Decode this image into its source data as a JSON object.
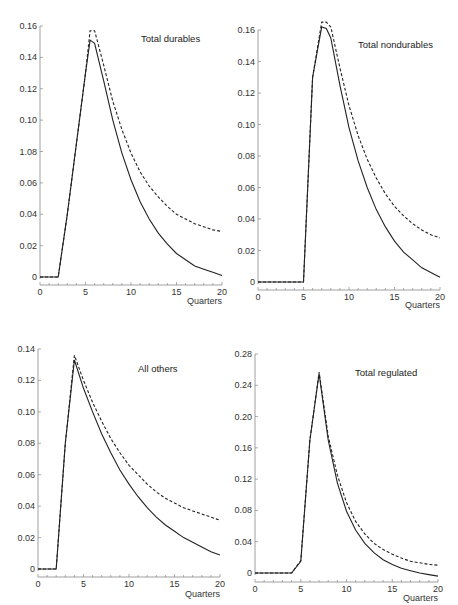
{
  "page": {
    "page_number": "217"
  },
  "chart_data": [
    {
      "type": "line",
      "title": "Total durables",
      "xlabel": "Quarters",
      "ylabel": "",
      "xlim": [
        0,
        20
      ],
      "ylim": [
        0,
        0.16
      ],
      "x_ticks": [
        "0",
        "5",
        "10",
        "15",
        "20"
      ],
      "y_ticks": [
        "0",
        "0.02",
        "0.04",
        "0.06",
        "1.08",
        "0.10",
        "0.12",
        "0.14",
        "0.16"
      ],
      "grid": false,
      "x": [
        0,
        1,
        2,
        3,
        4,
        5,
        5.5,
        6,
        7,
        8,
        9,
        10,
        11,
        12,
        13,
        14,
        15,
        16,
        17,
        18,
        19,
        20
      ],
      "series": [
        {
          "name": "solid",
          "style": "solid",
          "values": [
            0,
            0,
            0,
            0.04,
            0.085,
            0.13,
            0.151,
            0.149,
            0.125,
            0.1,
            0.079,
            0.062,
            0.048,
            0.037,
            0.028,
            0.021,
            0.015,
            0.011,
            0.007,
            0.005,
            0.003,
            0.001
          ]
        },
        {
          "name": "dashed",
          "style": "dashed",
          "values": [
            0,
            0,
            0,
            0.04,
            0.085,
            0.13,
            0.157,
            0.157,
            0.135,
            0.112,
            0.094,
            0.079,
            0.067,
            0.058,
            0.051,
            0.045,
            0.04,
            0.037,
            0.034,
            0.032,
            0.03,
            0.029
          ]
        }
      ]
    },
    {
      "type": "line",
      "title": "Total nondurables",
      "xlabel": "Quarters",
      "ylabel": "",
      "xlim": [
        0,
        20
      ],
      "ylim": [
        0,
        0.16
      ],
      "x_ticks": [
        "0",
        "5",
        "10",
        "15",
        "20"
      ],
      "y_ticks": [
        "0",
        "0.02",
        "0.04",
        "0.06",
        "0.08",
        "0.10",
        "0.12",
        "0.14",
        "0.16"
      ],
      "grid": false,
      "x": [
        0,
        1,
        2,
        3,
        4,
        5,
        6,
        7,
        7.5,
        8,
        9,
        10,
        11,
        12,
        13,
        14,
        15,
        16,
        17,
        18,
        19,
        20
      ],
      "series": [
        {
          "name": "solid",
          "style": "solid",
          "values": [
            0,
            0,
            0,
            0,
            0,
            0,
            0.13,
            0.162,
            0.161,
            0.155,
            0.125,
            0.098,
            0.077,
            0.06,
            0.046,
            0.035,
            0.026,
            0.019,
            0.014,
            0.009,
            0.006,
            0.003
          ]
        },
        {
          "name": "dashed",
          "style": "dashed",
          "values": [
            0,
            0,
            0,
            0,
            0,
            0,
            0.13,
            0.165,
            0.165,
            0.162,
            0.136,
            0.112,
            0.093,
            0.078,
            0.066,
            0.056,
            0.048,
            0.042,
            0.037,
            0.033,
            0.03,
            0.028
          ]
        }
      ]
    },
    {
      "type": "line",
      "title": "All others",
      "xlabel": "Quarters",
      "ylabel": "",
      "xlim": [
        0,
        20
      ],
      "ylim": [
        0,
        0.14
      ],
      "x_ticks": [
        "0",
        "5",
        "10",
        "15",
        "20"
      ],
      "y_ticks": [
        "0",
        "0.02",
        "0.04",
        "0.06",
        "0.08",
        "0.10",
        "0.12",
        "0.14"
      ],
      "grid": false,
      "x": [
        0,
        1,
        2,
        3,
        4,
        5,
        6,
        7,
        8,
        9,
        10,
        11,
        12,
        13,
        14,
        15,
        16,
        17,
        18,
        19,
        20
      ],
      "series": [
        {
          "name": "solid",
          "style": "solid",
          "values": [
            0,
            0,
            0,
            0.08,
            0.133,
            0.115,
            0.1,
            0.086,
            0.074,
            0.063,
            0.054,
            0.046,
            0.039,
            0.033,
            0.028,
            0.024,
            0.02,
            0.017,
            0.014,
            0.011,
            0.009
          ]
        },
        {
          "name": "dashed",
          "style": "dashed",
          "values": [
            0,
            0,
            0,
            0.08,
            0.136,
            0.12,
            0.106,
            0.094,
            0.083,
            0.074,
            0.066,
            0.06,
            0.054,
            0.049,
            0.045,
            0.042,
            0.039,
            0.037,
            0.035,
            0.033,
            0.031
          ]
        }
      ]
    },
    {
      "type": "line",
      "title": "Total regulated",
      "xlabel": "Quarters",
      "ylabel": "",
      "xlim": [
        0,
        20
      ],
      "ylim": [
        0,
        0.28
      ],
      "x_ticks": [
        "0",
        "5",
        "10",
        "15",
        "20"
      ],
      "y_ticks": [
        "0",
        "0.04",
        "0.08",
        "0.12",
        "0.16",
        "0.20",
        "0.24",
        "0.28"
      ],
      "grid": false,
      "x": [
        0,
        1,
        2,
        3,
        4,
        5,
        6,
        7,
        8,
        9,
        10,
        11,
        12,
        13,
        14,
        15,
        16,
        17,
        18,
        19,
        20
      ],
      "series": [
        {
          "name": "solid",
          "style": "solid",
          "values": [
            0,
            0,
            0,
            0,
            0,
            0.015,
            0.17,
            0.255,
            0.17,
            0.115,
            0.079,
            0.055,
            0.038,
            0.026,
            0.017,
            0.011,
            0.006,
            0.003,
            0.0,
            -0.002,
            -0.004
          ]
        },
        {
          "name": "dashed",
          "style": "dashed",
          "values": [
            0,
            0,
            0,
            0,
            0,
            0.016,
            0.17,
            0.257,
            0.175,
            0.125,
            0.09,
            0.066,
            0.05,
            0.038,
            0.03,
            0.024,
            0.019,
            0.015,
            0.013,
            0.011,
            0.01
          ]
        }
      ]
    }
  ]
}
